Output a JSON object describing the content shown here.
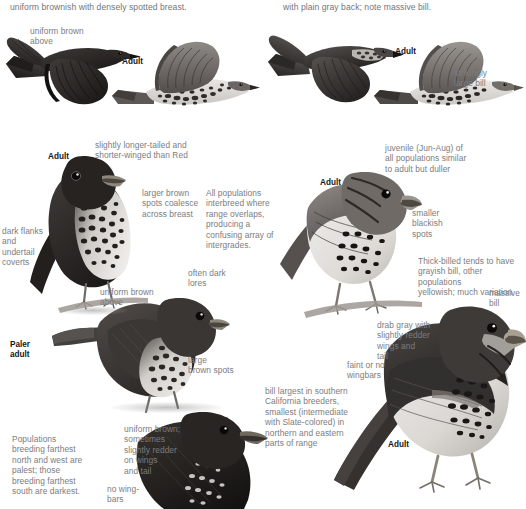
{
  "page": {
    "width": 526,
    "height": 509,
    "background": "#ffffff",
    "text_color": "#7c7c80",
    "label_color": "#161616"
  },
  "headers": [
    {
      "id": "header-left",
      "text": "uniform brownish with densely spotted breast."
    },
    {
      "id": "header-right",
      "text": "with plain gray back; note massive bill."
    }
  ],
  "annotations": [
    {
      "id": "uniform-brown-above-1",
      "text": "uniform brown\nabove"
    },
    {
      "id": "strikingly-large-bill",
      "text": "strikingly\nlarge bill"
    },
    {
      "id": "longer-tailed",
      "text": "slightly longer-tailed and\nshorter-winged than Red"
    },
    {
      "id": "juvenile-note",
      "text": "juvenile (Jun-Aug) of\nall populations similar\nto adult but duller"
    },
    {
      "id": "larger-brown-spots",
      "text": "larger brown\nspots coalesce\nacross breast"
    },
    {
      "id": "all-populations",
      "text": "All populations\ninterbreed where\nrange overlaps,\nproducing a\nconfusing array of\nintergrades."
    },
    {
      "id": "smaller-blackish-spots",
      "text": "smaller\nblackish\nspots"
    },
    {
      "id": "dark-flanks",
      "text": "dark flanks\nand\nundertail\ncoverts"
    },
    {
      "id": "thick-billed-note",
      "text": "Thick-billed tends to have\ngrayish bill, other populations\nyellowish; much variation"
    },
    {
      "id": "often-dark-lores",
      "text": "often dark\nlores"
    },
    {
      "id": "uniform-brown-above-2",
      "text": "uniform brown\nabove"
    },
    {
      "id": "massive-bill",
      "text": "massive\nbill"
    },
    {
      "id": "drab-gray",
      "text": "drab gray with\nslightly redder\nwings and\ntail"
    },
    {
      "id": "large-brown-spots",
      "text": "large\nbrown spots"
    },
    {
      "id": "faint-or-no-wingbars",
      "text": "faint or no\nwingbars"
    },
    {
      "id": "bill-largest",
      "text": "bill largest in southern\nCalifornia breeders,\nsmallest (intermediate\nwith Slate-colored) in\nnorthern and eastern\nparts of range"
    },
    {
      "id": "uniform-brown-sometimes",
      "text": "uniform brown;\nsometimes\nslightly redder\non wings\nand tail"
    },
    {
      "id": "populations-breeding",
      "text": "Populations\nbreeding farthest\nnorth and west are\npalest; those\nbreeding farthest\nsouth are darkest."
    },
    {
      "id": "no-wing-bars",
      "text": "no wing-\nbars"
    }
  ],
  "age_labels": [
    {
      "id": "adult-flight-left",
      "text": "Adult"
    },
    {
      "id": "adult-flight-right",
      "text": "Adult"
    },
    {
      "id": "adult-perched-left",
      "text": "Adult"
    },
    {
      "id": "adult-perched-right",
      "text": "Adult"
    },
    {
      "id": "paler-adult",
      "text": "Paler\nadult"
    },
    {
      "id": "adult-bottom-right",
      "text": "Adult"
    }
  ],
  "illustrations": [
    {
      "id": "flying-bird-dark-left",
      "species_note": "dark fox sparrow in flight, upperside, left"
    },
    {
      "id": "flying-bird-under-left",
      "species_note": "fox sparrow in flight, underside, spotted breast"
    },
    {
      "id": "flying-bird-gray-right",
      "species_note": "slate-colored fox sparrow in flight, upperside"
    },
    {
      "id": "flying-bird-under-right",
      "species_note": "thick-billed fox sparrow in flight, underside"
    },
    {
      "id": "perched-dark-adult",
      "species_note": "perched sooty fox sparrow adult, front view"
    },
    {
      "id": "perched-paler-adult",
      "species_note": "perched paler sooty fox sparrow adult"
    },
    {
      "id": "perched-dark-bottom",
      "species_note": "perched dark sooty fox sparrow, bottom left"
    },
    {
      "id": "perched-spotted-right",
      "species_note": "perched thick-billed fox sparrow adult, upper right"
    },
    {
      "id": "perched-gray-right",
      "species_note": "perched slate-colored fox sparrow adult, lower right"
    }
  ]
}
